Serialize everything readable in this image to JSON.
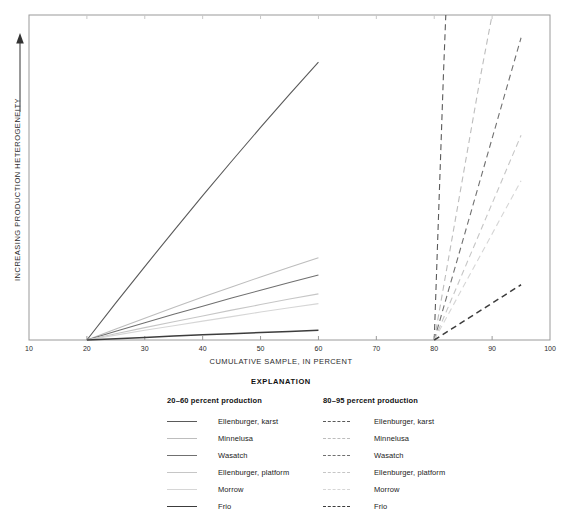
{
  "chart_data": {
    "type": "line",
    "title": "",
    "xlabel": "CUMULATIVE SAMPLE, IN PERCENT",
    "ylabel": "INCREASING PRODUCTION HETEROGENEITY",
    "xlim": [
      10,
      100
    ],
    "xticks": [
      10,
      20,
      30,
      40,
      50,
      60,
      70,
      80,
      90,
      100
    ],
    "xticklabels": [
      "10",
      "20",
      "30",
      "40",
      "50",
      "60",
      "70",
      "80",
      "90",
      "100"
    ],
    "ylim": [
      0,
      100
    ],
    "yticks": [],
    "yticklabels": [],
    "grid": false,
    "legend_position": "below",
    "legend_title": "EXPLANATION",
    "series": [
      {
        "name": "Ellenburger, karst",
        "group": "20-60 percent production",
        "style": "solid",
        "color": "#5a5a5a",
        "x": [
          20,
          25,
          30,
          35,
          40,
          45,
          50,
          55,
          60
        ],
        "y": [
          0,
          11.4,
          22.6,
          33.6,
          44.4,
          55.0,
          65.4,
          75.6,
          85.5
        ]
      },
      {
        "name": "Minnelusa",
        "group": "20-60 percent production",
        "style": "solid",
        "color": "#bdbdbd",
        "x": [
          20,
          25,
          30,
          35,
          40,
          45,
          50,
          55,
          60
        ],
        "y": [
          0,
          3.4,
          6.7,
          10.0,
          13.2,
          16.3,
          19.4,
          22.4,
          25.3
        ]
      },
      {
        "name": "Wasatch",
        "group": "20-60 percent production",
        "style": "solid",
        "color": "#707070",
        "x": [
          20,
          25,
          30,
          35,
          40,
          45,
          50,
          55,
          60
        ],
        "y": [
          0,
          2.7,
          5.3,
          7.9,
          10.4,
          12.9,
          15.3,
          17.7,
          20.0
        ]
      },
      {
        "name": "Ellenburger, platform",
        "group": "20-60 percent production",
        "style": "solid",
        "color": "#c6c6c6",
        "x": [
          20,
          25,
          30,
          35,
          40,
          45,
          50,
          55,
          60
        ],
        "y": [
          0,
          1.9,
          3.8,
          5.6,
          7.4,
          9.2,
          10.9,
          12.6,
          14.2
        ]
      },
      {
        "name": "Morrow",
        "group": "20-60 percent production",
        "style": "solid",
        "color": "#d6d6d6",
        "x": [
          20,
          25,
          30,
          35,
          40,
          45,
          50,
          55,
          60
        ],
        "y": [
          0,
          1.5,
          3.0,
          4.4,
          5.8,
          7.2,
          8.6,
          9.9,
          11.2
        ]
      },
      {
        "name": "Frio",
        "group": "20-60 percent production",
        "style": "solid",
        "color": "#3c3c3c",
        "x": [
          20,
          25,
          30,
          35,
          40,
          45,
          50,
          55,
          60
        ],
        "y": [
          0,
          0.4,
          0.8,
          1.2,
          1.6,
          1.9,
          2.3,
          2.6,
          3.0
        ]
      },
      {
        "name": "Ellenburger, karst",
        "group": "80-95 percent production",
        "style": "dashed",
        "color": "#5a5a5a",
        "x": [
          80,
          80.4,
          80.8,
          81.2,
          81.6,
          82.0
        ],
        "y": [
          0,
          20.5,
          41.0,
          61.5,
          82.0,
          100.0
        ]
      },
      {
        "name": "Minnelusa",
        "group": "80-95 percent production",
        "style": "dashed",
        "color": "#bdbdbd",
        "x": [
          80,
          82,
          84,
          86,
          88,
          90
        ],
        "y": [
          0,
          20.3,
          40.6,
          60.9,
          81.2,
          100.0
        ]
      },
      {
        "name": "Wasatch",
        "group": "80-95 percent production",
        "style": "dashed",
        "color": "#707070",
        "x": [
          80,
          83,
          86,
          89,
          92,
          95
        ],
        "y": [
          0,
          18.6,
          37.2,
          55.8,
          74.4,
          93.0
        ]
      },
      {
        "name": "Ellenburger, platform",
        "group": "80-95 percent production",
        "style": "dashed",
        "color": "#c6c6c6",
        "x": [
          80,
          83,
          86,
          89,
          92,
          95
        ],
        "y": [
          0,
          12.6,
          25.2,
          37.8,
          50.4,
          63.0
        ]
      },
      {
        "name": "Morrow",
        "group": "80-95 percent production",
        "style": "dashed",
        "color": "#d6d6d6",
        "x": [
          80,
          83,
          86,
          89,
          92,
          95
        ],
        "y": [
          0,
          9.8,
          19.6,
          29.4,
          39.2,
          49.0
        ]
      },
      {
        "name": "Frio",
        "group": "80-95 percent production",
        "style": "dashed",
        "color": "#3c3c3c",
        "x": [
          80,
          83,
          86,
          89,
          92,
          95
        ],
        "y": [
          0,
          3.4,
          6.8,
          10.2,
          13.6,
          17.0
        ]
      }
    ]
  },
  "axes": {
    "x_title": "CUMULATIVE SAMPLE, IN PERCENT",
    "y_title": "INCREASING PRODUCTION HETEROGENEITY",
    "tick_labels": [
      "10",
      "20",
      "30",
      "40",
      "50",
      "60",
      "70",
      "80",
      "90",
      "100"
    ]
  },
  "legend": {
    "title": "EXPLANATION",
    "columns": [
      {
        "heading": "20–60 percent production",
        "style": "solid",
        "entries": [
          {
            "label": "Ellenburger, karst",
            "color": "#5a5a5a"
          },
          {
            "label": "Minnelusa",
            "color": "#bdbdbd"
          },
          {
            "label": "Wasatch",
            "color": "#707070"
          },
          {
            "label": "Ellenburger, platform",
            "color": "#c6c6c6"
          },
          {
            "label": "Morrow",
            "color": "#d6d6d6"
          },
          {
            "label": "Frio",
            "color": "#3c3c3c"
          }
        ]
      },
      {
        "heading": "80–95 percent production",
        "style": "dashed",
        "entries": [
          {
            "label": "Ellenburger, karst",
            "color": "#5a5a5a"
          },
          {
            "label": "Minnelusa",
            "color": "#bdbdbd"
          },
          {
            "label": "Wasatch",
            "color": "#707070"
          },
          {
            "label": "Ellenburger, platform",
            "color": "#c6c6c6"
          },
          {
            "label": "Morrow",
            "color": "#d6d6d6"
          },
          {
            "label": "Frio",
            "color": "#3c3c3c"
          }
        ]
      }
    ]
  },
  "colors": {
    "frame": "#9a9a9a",
    "text": "#2b2b2b",
    "background": "#ffffff"
  }
}
